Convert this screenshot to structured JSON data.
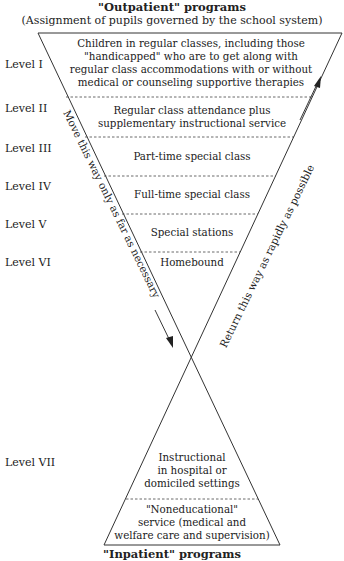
{
  "header": {
    "title": "\"Outpatient\" programs",
    "subtitle": "(Assignment of pupils governed by the school system)"
  },
  "footer": {
    "title": "\"Inpatient\" programs"
  },
  "levels": [
    {
      "label": "Level I",
      "text": [
        "Children in regular classes, including those",
        "\"handicapped\" who are to get along with",
        "regular class accommodations with or without",
        "medical or counseling supportive therapies"
      ]
    },
    {
      "label": "Level II",
      "text": [
        "Regular class attendance plus",
        "supplementary instructional service"
      ]
    },
    {
      "label": "Level III",
      "text": [
        "Part-time special class"
      ]
    },
    {
      "label": "Level IV",
      "text": [
        "Full-time special class"
      ]
    },
    {
      "label": "Level V",
      "text": [
        "Special stations"
      ]
    },
    {
      "label": "Level VI",
      "text": [
        "Homebound"
      ]
    },
    {
      "label": "Level VII",
      "text": [
        "Instructional",
        "in hospital or",
        "domiciled settings"
      ]
    }
  ],
  "bottom_box": {
    "text": [
      "\"Noneducational\"",
      "service (medical and",
      "welfare care and supervision)"
    ]
  },
  "arrows": {
    "down_label": "Move this way only as far as necessary",
    "up_label": "Return this way as rapidly as possible"
  },
  "colors": {
    "line": "#333333",
    "text": "#222222"
  }
}
